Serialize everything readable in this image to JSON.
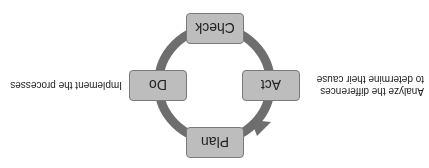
{
  "diagram": {
    "orientation": "rotated 180 degrees",
    "ring_color": "#6e6e6e",
    "box_color": "#bdbdbd",
    "steps": [
      {
        "label": "Plan",
        "position": "top"
      },
      {
        "label": "Do",
        "position": "left"
      },
      {
        "label": "Check",
        "position": "bottom"
      },
      {
        "label": "Act",
        "position": "right"
      }
    ],
    "notes": {
      "do": "Implement the processes",
      "act_line1": "Analyze the differences",
      "act_line2": "to determine their cause"
    }
  }
}
